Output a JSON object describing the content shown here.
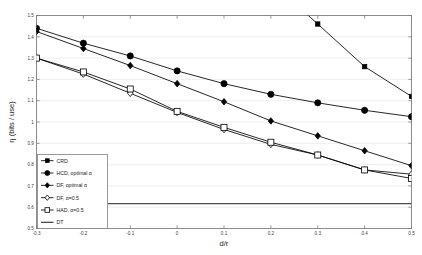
{
  "chart": {
    "type": "line",
    "ylabel": "η (bits / use)",
    "xlabel": "d/r"
  },
  "chart_data": {
    "type": "line",
    "title": "",
    "subtitle": "",
    "xlabel": "d/r",
    "ylabel": "η (bits / use)",
    "xlim": [
      -0.3,
      0.5
    ],
    "ylim": [
      0.5,
      1.5
    ],
    "xticks": [
      -0.3,
      -0.2,
      -0.1,
      0,
      0.1,
      0.2,
      0.3,
      0.4,
      0.5
    ],
    "xtick_labels": [
      "-0.3",
      "-0.2",
      "-0.1",
      "0",
      "0.1",
      "0.2",
      "0.3",
      "0.4",
      "0.5"
    ],
    "yticks": [
      0.5,
      0.6,
      0.7,
      0.8,
      0.9,
      1.0,
      1.1,
      1.2,
      1.3,
      1.4,
      1.5
    ],
    "ytick_labels": [
      "0.5",
      "0.6",
      "0.7",
      "0.8",
      "0.9",
      "1",
      "1.1",
      "1.2",
      "1.3",
      "1.4",
      "1.5"
    ],
    "grid": true,
    "grid_axis": "y",
    "legend_position": "lower-left",
    "x": [
      -0.3,
      -0.2,
      -0.1,
      0,
      0.1,
      0.2,
      0.3,
      0.4,
      0.5
    ],
    "series": [
      {
        "name": "CRD",
        "marker": "filled-square",
        "marker_size": 2.2,
        "color": "#000000",
        "values": [
          null,
          null,
          null,
          null,
          null,
          null,
          1.46,
          1.26,
          1.12
        ],
        "clipped_above": true,
        "note": "enters plot box from top at approximately d/r = 0.27"
      },
      {
        "name": "HCD, optimal α",
        "marker": "filled-circle",
        "marker_size": 3.1,
        "color": "#000000",
        "values": [
          1.44,
          1.37,
          1.31,
          1.24,
          1.18,
          1.13,
          1.09,
          1.055,
          1.025
        ]
      },
      {
        "name": "DF, optimal α",
        "marker": "filled-diamond",
        "marker_size": 3.3,
        "color": "#000000",
        "values": [
          1.425,
          1.345,
          1.265,
          1.18,
          1.095,
          1.005,
          0.935,
          0.865,
          0.795
        ]
      },
      {
        "name": "DF, α=0.5",
        "marker": "open-diamond",
        "marker_size": 3.3,
        "color": "#000000",
        "values": [
          1.3,
          1.225,
          1.135,
          1.045,
          0.965,
          0.895,
          0.845,
          0.775,
          0.755
        ]
      },
      {
        "name": "HAD, α=0.5",
        "marker": "open-square",
        "marker_size": 3.0,
        "color": "#000000",
        "values": [
          1.3,
          1.235,
          1.155,
          1.05,
          0.975,
          0.905,
          0.845,
          0.775,
          0.735
        ]
      },
      {
        "name": "DT",
        "marker": "none",
        "line_color": "#4d4d4d",
        "line_width": 1.3,
        "constant": 0.617,
        "values": [
          0.617,
          0.617,
          0.617,
          0.617,
          0.617,
          0.617,
          0.617,
          0.617,
          0.617
        ]
      }
    ]
  },
  "legend": {
    "items": [
      {
        "label": "CRD",
        "marker": "filled-square"
      },
      {
        "label": "HCD, optimal α",
        "marker": "filled-circle"
      },
      {
        "label": "DF, optimal α",
        "marker": "filled-diamond"
      },
      {
        "label": "DF, α=0.5",
        "marker": "open-diamond"
      },
      {
        "label": "HAD, α=0.5",
        "marker": "open-square"
      },
      {
        "label": "DT",
        "marker": "none"
      }
    ]
  },
  "colors": {
    "axis": "#808080",
    "grid": "#e8e8e8",
    "data": "#000000",
    "dt_line": "#4d4d4d",
    "background": "#ffffff"
  }
}
